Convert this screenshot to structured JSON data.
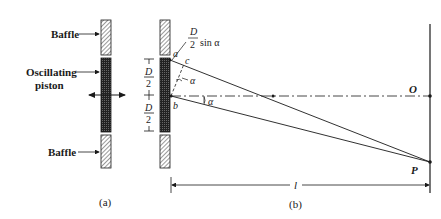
{
  "figure_a": {
    "caption": "(a)",
    "labels": {
      "baffle_top": "Baffle",
      "piston_line1": "Oscillating",
      "piston_line2": "piston",
      "baffle_bottom": "Baffle"
    }
  },
  "figure_b": {
    "caption": "(b)",
    "labels": {
      "path_diff_num": "D",
      "path_diff_den": "2",
      "path_diff_suffix": "sin α",
      "point_a": "a",
      "point_b": "b",
      "point_c": "c",
      "angle_upper": "α",
      "angle_lower": "α",
      "half_width_top_num": "D",
      "half_width_top_den": "2",
      "half_width_bottom_num": "D",
      "half_width_bottom_den": "2",
      "point_O": "O",
      "point_P": "P",
      "distance": "l"
    }
  },
  "colors": {
    "ink": "#1a1a1a",
    "piston_fill": "#2b2b2b",
    "baffle_fill": "#9a9a9a"
  }
}
